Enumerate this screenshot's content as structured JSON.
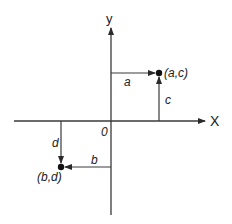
{
  "diagram": {
    "axes": {
      "x_label": "X",
      "y_label": "y",
      "origin_label": "0"
    },
    "points": [
      {
        "label": "(a,c)",
        "horizontal_label": "a",
        "vertical_label": "c"
      },
      {
        "label": "(b,d)",
        "horizontal_label": "b",
        "vertical_label": "d"
      }
    ],
    "colors": {
      "line": "#3a3a3a",
      "text": "#222222",
      "background": "#ffffff"
    }
  }
}
